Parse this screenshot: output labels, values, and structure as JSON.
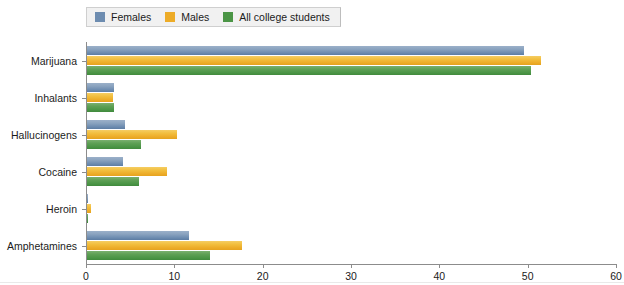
{
  "legend": {
    "position": "top-left",
    "entries": [
      {
        "label": "Females",
        "color": "#6d8cb0",
        "icon": "legend-swatch-icon"
      },
      {
        "label": "Males",
        "color": "#edac28",
        "icon": "legend-swatch-icon"
      },
      {
        "label": "All college students",
        "color": "#4b9546",
        "icon": "legend-swatch-icon"
      }
    ]
  },
  "axis": {
    "x_ticks": [
      "0",
      "10",
      "20",
      "30",
      "40",
      "50",
      "60"
    ]
  },
  "chart_data": {
    "type": "bar",
    "orientation": "horizontal",
    "title": "",
    "subtitle": "",
    "xlabel": "",
    "ylabel": "",
    "xlim": [
      0,
      60
    ],
    "xticks": [
      0,
      10,
      20,
      30,
      40,
      50,
      60
    ],
    "grid": false,
    "legend_position": "top-left",
    "categories": [
      "Marijuana",
      "Inhalants",
      "Hallucinogens",
      "Cocaine",
      "Heroin",
      "Amphetamines"
    ],
    "series": [
      {
        "name": "Females",
        "color": "#6d8cb0",
        "values": [
          49.5,
          3.1,
          4.3,
          4.1,
          0.1,
          11.6
        ]
      },
      {
        "name": "Males",
        "color": "#edac28",
        "values": [
          51.4,
          2.9,
          10.2,
          9.1,
          0.4,
          17.5
        ]
      },
      {
        "name": "All college students",
        "color": "#4b9546",
        "values": [
          50.3,
          3.0,
          6.1,
          5.9,
          0.1,
          13.9
        ]
      }
    ]
  }
}
